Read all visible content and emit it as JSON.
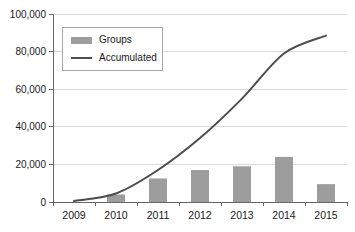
{
  "chart_data": {
    "type": "combo",
    "categories": [
      "2009",
      "2010",
      "2011",
      "2012",
      "2013",
      "2014",
      "2015"
    ],
    "series": [
      {
        "name": "Groups",
        "type": "bar",
        "color": "#9d9d9d",
        "values": [
          0,
          4000,
          12500,
          17000,
          19000,
          24000,
          9500
        ]
      },
      {
        "name": "Accumulated",
        "type": "line",
        "color": "#4d4d4d",
        "values": [
          500,
          4500,
          17000,
          34000,
          55000,
          79000,
          88500
        ]
      }
    ],
    "title": "",
    "xlabel": "",
    "ylabel": "",
    "ylim": [
      0,
      100000
    ],
    "y_ticks": [
      0,
      20000,
      40000,
      60000,
      80000,
      100000
    ],
    "y_tick_labels": [
      "0",
      "20,000",
      "40,000",
      "60,000",
      "80,000",
      "100,000"
    ],
    "grid": true,
    "legend_position": "top-left",
    "colors": {
      "grid": "#d9d9d9",
      "axis": "#666666",
      "text": "#1a1a1a",
      "background": "#ffffff"
    }
  }
}
